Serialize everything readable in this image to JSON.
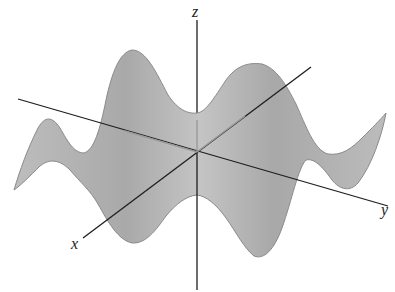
{
  "diagram": {
    "type": "3d-surface-plot",
    "axes": {
      "x_label": "x",
      "y_label": "y",
      "z_label": "z"
    },
    "colors": {
      "surface_fill": "#b3b3b3",
      "surface_edge": "#8a8a8a",
      "axis": "#1e1e1e",
      "background": "#ffffff"
    }
  }
}
